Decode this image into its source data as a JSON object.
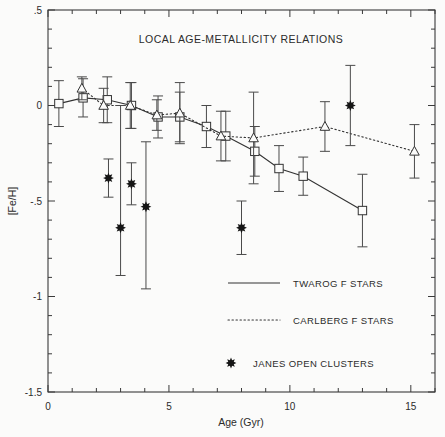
{
  "chart_data": {
    "type": "scatter",
    "title": "LOCAL AGE-METALLICITY RELATIONS",
    "xlabel": "Age (Gyr)",
    "ylabel": "[Fe/H]",
    "xlim": [
      0,
      16.0
    ],
    "ylim": [
      -1.5,
      0.5
    ],
    "xticks": [
      0,
      5,
      10,
      15
    ],
    "xtick_labels": [
      "0",
      "5",
      "10",
      "15"
    ],
    "yticks": [
      0.5,
      0,
      -0.5,
      -1,
      -1.5
    ],
    "ytick_labels": [
      ".5",
      "0",
      "-.5",
      "-1",
      "-1.5"
    ],
    "xminor_step": 1,
    "yminor_step": 0.1,
    "grid": false,
    "legend_position": "lower-right-inside",
    "series": [
      {
        "name": "TWAROG F STARS",
        "style": "solid-line-with-open-squares",
        "marker": "open-square",
        "x": [
          0.45,
          1.45,
          2.45,
          3.45,
          4.55,
          5.45,
          6.55,
          7.35,
          8.55,
          9.55,
          10.55,
          13.0
        ],
        "y": [
          0.01,
          0.04,
          0.03,
          0.0,
          -0.06,
          -0.06,
          -0.11,
          -0.16,
          -0.24,
          -0.33,
          -0.37,
          -0.55
        ],
        "yerr": [
          0.12,
          0.1,
          0.12,
          0.12,
          0.11,
          0.13,
          0.11,
          0.13,
          0.13,
          0.12,
          0.1,
          0.19
        ]
      },
      {
        "name": "CARLBERG F STARS",
        "style": "dotted-line-with-open-triangles",
        "marker": "open-triangle",
        "x": [
          1.4,
          2.3,
          3.4,
          4.5,
          5.45,
          7.15,
          8.5,
          11.45,
          15.15
        ],
        "y": [
          0.09,
          0.0,
          0.0,
          -0.05,
          -0.04,
          -0.16,
          -0.17,
          -0.11,
          -0.24
        ],
        "yerr": [
          0.06,
          0.09,
          0.12,
          0.08,
          0.16,
          0.13,
          0.24,
          0.13,
          0.14
        ]
      },
      {
        "name": "JANES OPEN CLUSTERS",
        "style": "filled-asterisk-points",
        "marker": "filled-asterisk",
        "x": [
          2.5,
          3.0,
          3.45,
          4.05,
          8.0,
          12.5
        ],
        "y": [
          -0.38,
          -0.64,
          -0.41,
          -0.53,
          -0.64,
          0.0
        ],
        "yerr_lo": [
          0.1,
          0.25,
          0.11,
          0.43,
          0.14,
          0.21
        ],
        "yerr_hi": [
          0.1,
          0.64,
          0.11,
          0.34,
          0.14,
          0.21
        ]
      }
    ]
  },
  "legend": {
    "entries": [
      {
        "label": "TWAROG F STARS",
        "symbol": "solid-line"
      },
      {
        "label": "CARLBERG F STARS",
        "symbol": "dotted-line"
      },
      {
        "label": "JANES OPEN CLUSTERS",
        "symbol": "filled-asterisk"
      }
    ]
  },
  "colors": {
    "background": "#fbfbfa",
    "axis": "#3a3a3a",
    "ink": "#2b2b2b",
    "marker_fill": "#fbfbfa",
    "janes_fill": "#151515"
  }
}
